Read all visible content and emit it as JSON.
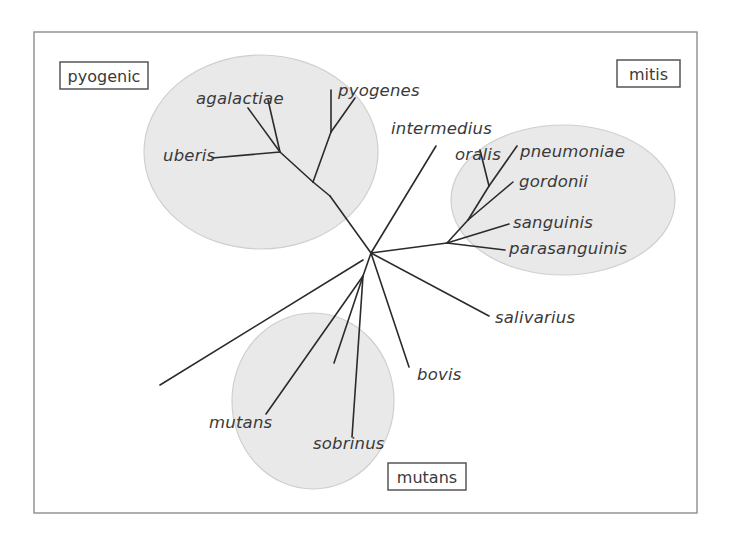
{
  "figure": {
    "width": 731,
    "height": 539,
    "background_color": "#ffffff",
    "frame": {
      "x": 34,
      "y": 32,
      "width": 663,
      "height": 481,
      "stroke_color": "#8d8d8d"
    }
  },
  "style": {
    "branch_color": "#2b2b2b",
    "ellipse_fill": "#e9e9e9",
    "ellipse_stroke": "#cfcfcf",
    "label_color": "#3a3a3a",
    "box_stroke": "#555555"
  },
  "group_boxes": [
    {
      "name": "pyogenic",
      "label": "pyogenic",
      "x": 60,
      "y": 62,
      "width": 88,
      "height": 27
    },
    {
      "name": "mitis",
      "label": "mitis",
      "x": 617,
      "y": 60,
      "width": 63,
      "height": 27
    },
    {
      "name": "mutans",
      "label": "mutans",
      "x": 388,
      "y": 463,
      "width": 78,
      "height": 27
    }
  ],
  "group_ellipses": [
    {
      "name": "pyogenic-group",
      "cx": 261,
      "cy": 152,
      "rx": 117,
      "ry": 97,
      "rotate": 0
    },
    {
      "name": "mitis-group",
      "cx": 563,
      "cy": 200,
      "rx": 112,
      "ry": 75,
      "rotate": 0
    },
    {
      "name": "mutans-group",
      "cx": 313,
      "cy": 401,
      "rx": 81,
      "ry": 88,
      "rotate": 0
    }
  ],
  "taxa": [
    {
      "name": "agalactiae",
      "label": "agalactiae",
      "x": 196,
      "y": 104,
      "anchor": "start",
      "group": "pyogenic"
    },
    {
      "name": "pyogenes",
      "label": "pyogenes",
      "x": 338,
      "y": 96,
      "anchor": "start",
      "group": "pyogenic"
    },
    {
      "name": "uberis",
      "label": "uberis",
      "x": 163,
      "y": 161,
      "anchor": "start",
      "group": "pyogenic"
    },
    {
      "name": "intermedius",
      "label": "intermedius",
      "x": 391,
      "y": 134,
      "anchor": "start",
      "group": "none"
    },
    {
      "name": "oralis",
      "label": "oralis",
      "x": 455,
      "y": 160,
      "anchor": "start",
      "group": "mitis"
    },
    {
      "name": "pneumoniae",
      "label": "pneumoniae",
      "x": 520,
      "y": 157,
      "anchor": "start",
      "group": "mitis"
    },
    {
      "name": "gordonii",
      "label": "gordonii",
      "x": 519,
      "y": 187,
      "anchor": "start",
      "group": "mitis"
    },
    {
      "name": "sanguinis",
      "label": "sanguinis",
      "x": 513,
      "y": 228,
      "anchor": "start",
      "group": "mitis"
    },
    {
      "name": "parasanguinis",
      "label": "parasanguinis",
      "x": 509,
      "y": 254,
      "anchor": "start",
      "group": "mitis"
    },
    {
      "name": "salivarius",
      "label": "salivarius",
      "x": 495,
      "y": 323,
      "anchor": "start",
      "group": "none"
    },
    {
      "name": "bovis",
      "label": "bovis",
      "x": 417,
      "y": 380,
      "anchor": "start",
      "group": "none"
    },
    {
      "name": "mutans",
      "label": "mutans",
      "x": 209,
      "y": 428,
      "anchor": "start",
      "group": "mutans"
    },
    {
      "name": "sobrinus",
      "label": "sobrinus",
      "x": 313,
      "y": 449,
      "anchor": "start",
      "group": "mutans"
    }
  ],
  "chart_data": {
    "type": "diagram",
    "subtype": "unrooted-phylogenetic-tree",
    "groups": [
      "pyogenic",
      "mitis",
      "mutans"
    ],
    "leaves": [
      "agalactiae",
      "pyogenes",
      "uberis",
      "intermedius",
      "oralis",
      "pneumoniae",
      "gordonii",
      "sanguinis",
      "parasanguinis",
      "salivarius",
      "bovis",
      "mutans",
      "sobrinus"
    ],
    "nodes": {
      "root": [
        371,
        253
      ],
      "pyogenic_hub": [
        330,
        196
      ],
      "pyogenic_inner": [
        313,
        182
      ],
      "agalactiae_fork": [
        280,
        152
      ],
      "pyogenes_fork": [
        330,
        133
      ],
      "mitis_hub": [
        447,
        243
      ],
      "mitis_inner": [
        468,
        220
      ],
      "mitis_upper": [
        489,
        186
      ],
      "mutans_hub": [
        363,
        276
      ],
      "unlabeled_tip": [
        160,
        385
      ]
    },
    "edges": [
      {
        "from": "root",
        "to": "pyogenic_hub"
      },
      {
        "from": "pyogenic_hub",
        "to": "pyogenic_inner"
      },
      {
        "from": "pyogenic_inner",
        "to": "agalactiae_fork"
      },
      {
        "from": "agalactiae_fork",
        "to": "agalactiae"
      },
      {
        "from": "agalactiae_fork",
        "to": "uberis"
      },
      {
        "from": "pyogenic_inner",
        "to": "pyogenes_fork"
      },
      {
        "from": "pyogenes_fork",
        "to": "pyogenes"
      },
      {
        "from": "root",
        "to": "mitis_hub"
      },
      {
        "from": "mitis_hub",
        "to": "sanguinis"
      },
      {
        "from": "mitis_hub",
        "to": "parasanguinis"
      },
      {
        "from": "mitis_hub",
        "to": "mitis_inner"
      },
      {
        "from": "mitis_inner",
        "to": "gordonii"
      },
      {
        "from": "mitis_inner",
        "to": "mitis_upper"
      },
      {
        "from": "mitis_upper",
        "to": "oralis"
      },
      {
        "from": "mitis_upper",
        "to": "pneumoniae"
      },
      {
        "from": "root",
        "to": "intermedius"
      },
      {
        "from": "root",
        "to": "salivarius"
      },
      {
        "from": "root",
        "to": "bovis"
      },
      {
        "from": "root",
        "to": "mutans_hub"
      },
      {
        "from": "mutans_hub",
        "to": "mutans"
      },
      {
        "from": "mutans_hub",
        "to": "sobrinus"
      },
      {
        "from": "mutans_hub",
        "to": "unlabeled_tip"
      },
      {
        "from": "pyogenic_hub",
        "to": "unlabeled_tip_via_left"
      }
    ]
  },
  "branch_paths": [
    {
      "name": "branch-root-to-pyogenic-hub",
      "d": "M 371 253 L 330 196"
    },
    {
      "name": "branch-pyogenic-hub-to-inner",
      "d": "M 330 196 L 313 182"
    },
    {
      "name": "branch-inner-to-agalactiae-fork",
      "d": "M 313 182 L 280 152"
    },
    {
      "name": "branch-agalactiae",
      "d": "M 280 152 L 268 100"
    },
    {
      "name": "branch-agalactiae-second",
      "d": "M 280 152 L 248 108"
    },
    {
      "name": "branch-uberis",
      "d": "M 280 152 L 212 158"
    },
    {
      "name": "branch-inner-to-pyogenes-fork",
      "d": "M 313 182 L 331 132"
    },
    {
      "name": "branch-pyogenes-upper",
      "d": "M 331 132 L 331 90"
    },
    {
      "name": "branch-pyogenes-second",
      "d": "M 331 132 L 355 98"
    },
    {
      "name": "branch-root-to-mitis-hub",
      "d": "M 371 253 L 447 243"
    },
    {
      "name": "branch-sanguinis",
      "d": "M 447 243 L 509 224"
    },
    {
      "name": "branch-parasanguinis",
      "d": "M 447 243 L 505 250"
    },
    {
      "name": "branch-mitis-hub-to-inner",
      "d": "M 447 243 L 468 220"
    },
    {
      "name": "branch-gordonii",
      "d": "M 468 220 L 513 182"
    },
    {
      "name": "branch-inner-to-upper",
      "d": "M 468 220 L 489 186"
    },
    {
      "name": "branch-oralis",
      "d": "M 489 186 L 480 150"
    },
    {
      "name": "branch-pneumoniae",
      "d": "M 489 186 L 517 146"
    },
    {
      "name": "branch-intermedius",
      "d": "M 371 253 L 436 146"
    },
    {
      "name": "branch-salivarius",
      "d": "M 371 253 L 489 316"
    },
    {
      "name": "branch-bovis",
      "d": "M 371 253 L 409 367"
    },
    {
      "name": "branch-root-to-mutans-hub",
      "d": "M 371 253 L 363 276"
    },
    {
      "name": "branch-mutans",
      "d": "M 363 276 L 266 414"
    },
    {
      "name": "branch-sobrinus",
      "d": "M 363 276 L 334 363"
    },
    {
      "name": "branch-mutans-third",
      "d": "M 363 276 L 352 437"
    },
    {
      "name": "branch-unlabeled-left",
      "d": "M 363 260 L 160 385"
    }
  ]
}
